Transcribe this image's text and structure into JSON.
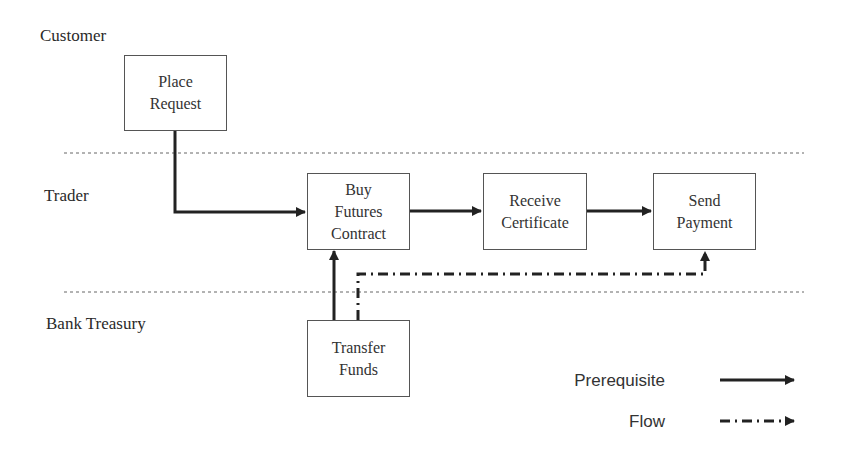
{
  "lanes": [
    {
      "id": "customer",
      "label": "Customer"
    },
    {
      "id": "trader",
      "label": "Trader"
    },
    {
      "id": "bank_treasury",
      "label": "Bank Treasury"
    }
  ],
  "activities": [
    {
      "id": "place_request",
      "lane": "customer",
      "lines": [
        "Place",
        "Request"
      ]
    },
    {
      "id": "buy_futures_contract",
      "lane": "trader",
      "lines": [
        "Buy",
        "Futures",
        "Contract"
      ]
    },
    {
      "id": "receive_certificate",
      "lane": "trader",
      "lines": [
        "Receive",
        "Certificate"
      ]
    },
    {
      "id": "send_payment",
      "lane": "trader",
      "lines": [
        "Send",
        "Payment"
      ]
    },
    {
      "id": "transfer_funds",
      "lane": "bank_treasury",
      "lines": [
        "Transfer",
        "Funds"
      ]
    }
  ],
  "connections": [
    {
      "from": "place_request",
      "to": "buy_futures_contract",
      "type": "prerequisite"
    },
    {
      "from": "buy_futures_contract",
      "to": "receive_certificate",
      "type": "prerequisite"
    },
    {
      "from": "receive_certificate",
      "to": "send_payment",
      "type": "prerequisite"
    },
    {
      "from": "transfer_funds",
      "to": "buy_futures_contract",
      "type": "prerequisite"
    },
    {
      "from": "transfer_funds",
      "to": "send_payment",
      "type": "flow"
    }
  ],
  "legend": {
    "prerequisite": "Prerequisite",
    "flow": "Flow"
  },
  "colors": {
    "line": "#222222",
    "lane_divider": "#666666"
  }
}
